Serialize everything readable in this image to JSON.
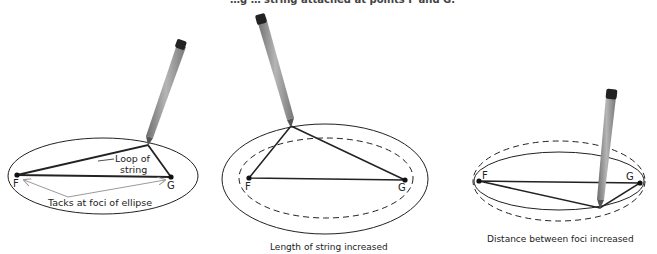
{
  "header": {
    "clipped_text": "…g … string attached at points F and G."
  },
  "diagrams": [
    {
      "id": "original",
      "foci_labels": [
        "F",
        "G"
      ],
      "annotations": {
        "loop": "Loop of\nstring",
        "loop_line1": "Loop of",
        "loop_line2": "string",
        "tacks": "Tacks at foci of ellipse"
      },
      "caption": ""
    },
    {
      "id": "longer-string",
      "foci_labels": [
        "F",
        "G"
      ],
      "caption": "Length of string increased"
    },
    {
      "id": "wider-foci",
      "foci_labels": [
        "F",
        "G"
      ],
      "caption": "Distance between foci increased"
    }
  ],
  "colors": {
    "line": "#222222",
    "pencil": "#8a8a8a",
    "arrow": "#9a9a9a"
  }
}
